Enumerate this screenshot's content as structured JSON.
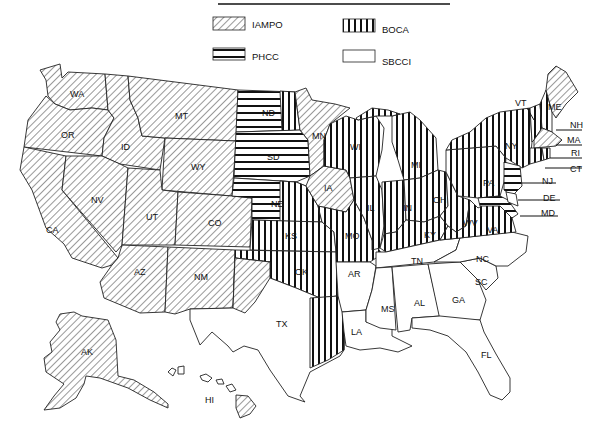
{
  "legend": {
    "items": [
      {
        "code": "IAMPO",
        "pattern": "diagonal-hatch",
        "label": "IAMPO"
      },
      {
        "code": "BOCA",
        "pattern": "vertical-lines",
        "label": "BOCA"
      },
      {
        "code": "PHCC",
        "pattern": "horizontal-lines",
        "label": "PHCC"
      },
      {
        "code": "SBCCI",
        "pattern": "blank",
        "label": "SBCCI"
      }
    ]
  },
  "colors": {
    "ink": "#1a1a1a",
    "background": "#ffffff"
  },
  "states": {
    "WA": {
      "label": "WA",
      "code": "IAMPO"
    },
    "OR": {
      "label": "OR",
      "code": "IAMPO"
    },
    "CA": {
      "label": "CA",
      "code": "IAMPO"
    },
    "ID": {
      "label": "ID",
      "code": "IAMPO"
    },
    "NV": {
      "label": "NV",
      "code": "IAMPO"
    },
    "MT": {
      "label": "MT",
      "code": "IAMPO"
    },
    "WY": {
      "label": "WY",
      "code": "IAMPO"
    },
    "UT": {
      "label": "UT",
      "code": "IAMPO"
    },
    "CO": {
      "label": "CO",
      "code": "IAMPO"
    },
    "AZ": {
      "label": "AZ",
      "code": "IAMPO"
    },
    "NM": {
      "label": "NM",
      "code": "IAMPO"
    },
    "ND": {
      "label": "ND",
      "code": "PHCC/BOCA"
    },
    "SD": {
      "label": "SD",
      "code": "PHCC"
    },
    "NE": {
      "label": "NE",
      "code": "PHCC/BOCA"
    },
    "KS": {
      "label": "KS",
      "code": "BOCA"
    },
    "OK": {
      "label": "OK",
      "code": "BOCA"
    },
    "TX": {
      "label": "TX",
      "code": "SBCCI/IAMPO/BOCA"
    },
    "MN": {
      "label": "MN",
      "code": "IAMPO/BOCA"
    },
    "IA": {
      "label": "IA",
      "code": "IAMPO"
    },
    "MO": {
      "label": "MO",
      "code": "BOCA"
    },
    "AR": {
      "label": "AR",
      "code": "SBCCI"
    },
    "LA": {
      "label": "LA",
      "code": "SBCCI"
    },
    "WI": {
      "label": "WI",
      "code": "BOCA"
    },
    "IL": {
      "label": "IL",
      "code": "BOCA"
    },
    "MI": {
      "label": "MI",
      "code": "BOCA"
    },
    "IN": {
      "label": "IN",
      "code": "BOCA"
    },
    "OH": {
      "label": "OH",
      "code": "BOCA"
    },
    "KY": {
      "label": "KY",
      "code": "BOCA"
    },
    "TN": {
      "label": "TN",
      "code": "SBCCI"
    },
    "MS": {
      "label": "MS",
      "code": "SBCCI"
    },
    "AL": {
      "label": "AL",
      "code": "SBCCI"
    },
    "GA": {
      "label": "GA",
      "code": "SBCCI"
    },
    "FL": {
      "label": "FL",
      "code": "SBCCI"
    },
    "SC": {
      "label": "SC",
      "code": "SBCCI"
    },
    "NC": {
      "label": "NC",
      "code": "SBCCI"
    },
    "VA": {
      "label": "VA",
      "code": "BOCA"
    },
    "WV": {
      "label": "WV",
      "code": "BOCA"
    },
    "PA": {
      "label": "PA",
      "code": "BOCA"
    },
    "NY": {
      "label": "NY",
      "code": "BOCA"
    },
    "NJ": {
      "label": "NJ",
      "code": "PHCC"
    },
    "DE": {
      "label": "DE",
      "code": "SBCCI"
    },
    "MD": {
      "label": "MD",
      "code": "PHCC"
    },
    "VT": {
      "label": "VT",
      "code": "BOCA"
    },
    "NH": {
      "label": "NH",
      "code": "BOCA"
    },
    "ME": {
      "label": "ME",
      "code": "IAMPO"
    },
    "MA": {
      "label": "MA",
      "code": "IAMPO"
    },
    "RI": {
      "label": "RI",
      "code": "BOCA"
    },
    "CT": {
      "label": "CT",
      "code": "BOCA"
    },
    "AK": {
      "label": "AK",
      "code": "IAMPO"
    },
    "HI": {
      "label": "HI",
      "code": "IAMPO"
    }
  }
}
